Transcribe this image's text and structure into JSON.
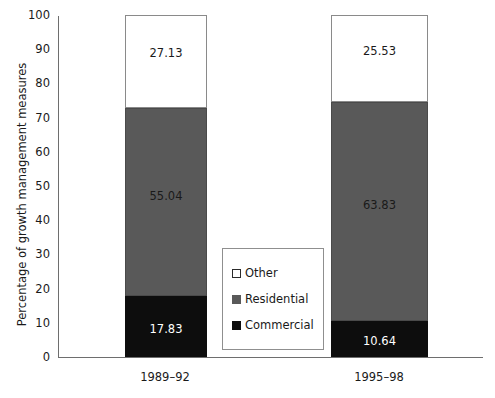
{
  "chart_data": {
    "type": "bar",
    "subtype": "stacked-100-percent",
    "title": "",
    "xlabel": "",
    "ylabel": "Percentage of growth management measures",
    "ylim": [
      0,
      100
    ],
    "ytick_step": 10,
    "yticks": [
      "100",
      "90",
      "80",
      "70",
      "60",
      "50",
      "40",
      "30",
      "20",
      "10",
      "0"
    ],
    "grid": false,
    "legend_position": "center",
    "categories": [
      "1989–92",
      "1995–98"
    ],
    "series": [
      {
        "name": "Commercial",
        "color": "#0d0d0d",
        "values": [
          17.83,
          10.64
        ],
        "labels": [
          "17.83",
          "10.64"
        ]
      },
      {
        "name": "Residential",
        "color": "#595959",
        "values": [
          55.04,
          63.83
        ],
        "labels": [
          "55.04",
          "63.83"
        ]
      },
      {
        "name": "Other",
        "color": "#ffffff",
        "values": [
          27.13,
          25.53
        ],
        "labels": [
          "27.13",
          "25.53"
        ]
      }
    ]
  },
  "legend": {
    "items": [
      {
        "label": "Other",
        "swatch": "white-square-outline"
      },
      {
        "label": "Residential",
        "swatch": "gray-square"
      },
      {
        "label": "Commercial",
        "swatch": "black-square"
      }
    ]
  },
  "axis": {
    "y_title": "Percentage of growth management measures",
    "y_tick_labels": [
      "100",
      "90",
      "80",
      "70",
      "60",
      "50",
      "40",
      "30",
      "20",
      "10",
      "0"
    ],
    "x_tick_labels": [
      "1989–92",
      "1995–98"
    ]
  }
}
